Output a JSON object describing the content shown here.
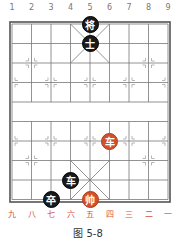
{
  "figure": {
    "caption": "图 5-8",
    "top_file_labels": [
      "1",
      "2",
      "3",
      "4",
      "5",
      "6",
      "7",
      "8",
      "9"
    ],
    "bottom_file_labels": [
      "九",
      "八",
      "七",
      "六",
      "五",
      "四",
      "三",
      "二",
      "一"
    ],
    "board": {
      "columns": 9,
      "rows": 10,
      "line_color": "#666666",
      "border_color": "#555555"
    },
    "pieces": [
      {
        "label": "将",
        "side": "black",
        "col": 4,
        "row": 0
      },
      {
        "label": "士",
        "side": "black",
        "col": 4,
        "row": 1
      },
      {
        "label": "车",
        "side": "red",
        "col": 5,
        "row": 6
      },
      {
        "label": "车",
        "side": "black",
        "col": 3,
        "row": 8
      },
      {
        "label": "卒",
        "side": "black",
        "col": 2,
        "row": 9
      },
      {
        "label": "帅",
        "side": "red",
        "col": 4,
        "row": 9
      }
    ],
    "colors": {
      "red_piece": "#d2502c",
      "black_piece": "#1a1a1a",
      "bottom_label": "#d6533a"
    }
  }
}
